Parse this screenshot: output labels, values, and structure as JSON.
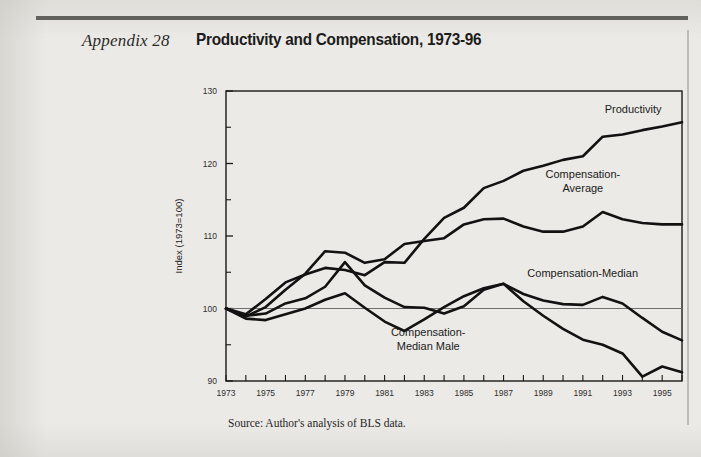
{
  "page": {
    "appendix_label": "Appendix 28",
    "title": "Productivity and Compensation, 1973-96",
    "source_note": "Source: Author's analysis of BLS data."
  },
  "chart_data": {
    "type": "line",
    "title": "Productivity and Compensation, 1973-96",
    "xlabel": "",
    "ylabel": "Index (1973=100)",
    "xlim": [
      1973,
      1996
    ],
    "ylim": [
      90,
      130
    ],
    "grid": false,
    "legend_position": "inline-annotations",
    "reference_line_y": 100,
    "y_major_ticks": [
      90,
      100,
      110,
      120,
      130
    ],
    "y_minor_ticks": [
      95,
      105,
      115,
      125
    ],
    "x_tick_labels": [
      "1973",
      "1975",
      "1977",
      "1979",
      "1981",
      "1983",
      "1985",
      "1987",
      "1989",
      "1991",
      "1993",
      "1995"
    ],
    "x_tick_values": [
      1973,
      1975,
      1977,
      1979,
      1981,
      1983,
      1985,
      1987,
      1989,
      1991,
      1993,
      1995
    ],
    "x": [
      1973,
      1974,
      1975,
      1976,
      1977,
      1978,
      1979,
      1980,
      1981,
      1982,
      1983,
      1984,
      1985,
      1986,
      1987,
      1988,
      1989,
      1990,
      1991,
      1992,
      1993,
      1994,
      1995,
      1996
    ],
    "series": [
      {
        "name": "Productivity",
        "color": "#121212",
        "label_x": 1992.1,
        "label_y": 127.0,
        "values": [
          100.0,
          99.2,
          101.3,
          103.6,
          104.7,
          105.6,
          105.3,
          104.6,
          106.4,
          106.3,
          109.6,
          112.5,
          113.9,
          116.6,
          117.6,
          119.0,
          119.7,
          120.5,
          121.0,
          123.7,
          124.0,
          124.6,
          125.1,
          125.7
        ]
      },
      {
        "name": "Compensation-Average",
        "color": "#121212",
        "label_x": 1991.0,
        "label_y": 118.0,
        "values": [
          100.0,
          98.9,
          100.2,
          102.6,
          104.8,
          107.9,
          107.7,
          106.3,
          106.8,
          108.9,
          109.3,
          109.7,
          111.6,
          112.3,
          112.4,
          111.3,
          110.6,
          110.6,
          111.3,
          113.3,
          112.3,
          111.8,
          111.6,
          111.6
        ]
      },
      {
        "name": "Compensation-Median",
        "color": "#121212",
        "label_x": 1988.2,
        "label_y": 104.3,
        "values": [
          100.0,
          99.0,
          99.3,
          100.7,
          101.4,
          103.0,
          106.4,
          103.2,
          101.5,
          100.2,
          100.1,
          99.3,
          100.3,
          102.6,
          103.4,
          102.0,
          101.1,
          100.6,
          100.5,
          101.6,
          100.7,
          98.7,
          96.8,
          95.6
        ]
      },
      {
        "name": "Compensation-Median Male",
        "color": "#121212",
        "label_x": 1983.2,
        "label_y": 96.2,
        "values": [
          100.0,
          98.6,
          98.4,
          99.2,
          100.0,
          101.2,
          102.1,
          100.1,
          98.2,
          96.9,
          98.5,
          100.2,
          101.7,
          102.8,
          103.4,
          101.0,
          99.0,
          97.2,
          95.7,
          95.0,
          93.8,
          90.6,
          92.0,
          91.2
        ]
      }
    ]
  }
}
